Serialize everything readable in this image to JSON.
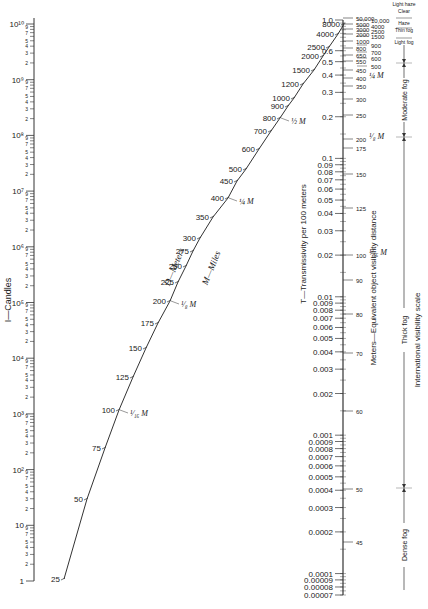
{
  "chart_data": {
    "type": "nomogram",
    "scales": {
      "candles": {
        "label": "I—Candles",
        "range": [
          1,
          10000000000
        ],
        "major_ticks": [
          "1",
          "10",
          "10²",
          "10³",
          "10⁴",
          "10⁵",
          "10⁶",
          "10⁷",
          "10⁸",
          "10⁹",
          "10¹⁰"
        ],
        "minor_tick_labels": [
          "2",
          "3",
          "4",
          "5",
          "7",
          "9"
        ]
      },
      "distance": {
        "label_meters": "D—Meters",
        "label_miles": "M—Miles",
        "meter_ticks": [
          25,
          50,
          75,
          100,
          125,
          150,
          175,
          200,
          225,
          250,
          275,
          300,
          350,
          400,
          450,
          500,
          600,
          700,
          800,
          900,
          1000,
          1200,
          1500,
          2000,
          2500,
          4000,
          8000
        ],
        "mile_marks": [
          {
            "label": "1/16 M",
            "at_meters": 100
          },
          {
            "label": "1/8 M",
            "at_meters": 200
          },
          {
            "label": "1/4 M",
            "at_meters": 400
          },
          {
            "label": "1/2 M",
            "at_meters": 800
          }
        ]
      },
      "transmissivity": {
        "label": "T—Transmissivity per 100 meters",
        "ticks": [
          "1.0",
          "0.6",
          "0.5",
          "0.4",
          "0.3",
          "0.2",
          "0.1",
          "0.09",
          "0.08",
          "0.07",
          "0.06",
          "0.05",
          "0.04",
          "0.03",
          "0.02",
          "0.01",
          "0.009",
          "0.008",
          "0.007",
          "0.006",
          "0.005",
          "0.004",
          "0.003",
          "0.002",
          "0.001",
          "0.0009",
          "0.0008",
          "0.0007",
          "0.0006",
          "0.0005",
          "0.0004",
          "0.0003",
          "0.0002",
          "0.0001",
          "0.00009",
          "0.00008",
          "0.00007"
        ]
      },
      "visibility_distance": {
        "label": "Meters—Equivalent object visibility distance",
        "ticks_left_column": [
          "50,000",
          "5000",
          "3000",
          "2000",
          "1000",
          "800",
          "650",
          "550",
          "450",
          "400",
          "350",
          "300",
          "250",
          "200",
          "175",
          "150",
          "125",
          "100",
          "90",
          "80",
          "70",
          "60",
          "50",
          "45"
        ],
        "ticks_right_column": [
          "10,000",
          "4000",
          "2500",
          "1500",
          "900",
          "700",
          "600",
          "500"
        ],
        "mile_marks": [
          {
            "label": "1/4 M",
            "at": 400
          },
          {
            "label": "1/8 M",
            "at": 200
          },
          {
            "label": "1/16 M",
            "at": 100
          }
        ]
      },
      "international_visibility": {
        "label": "International visibility scale",
        "categories": [
          "Light haze",
          "Clear",
          "Haze",
          "Thin fog",
          "Light fog",
          "Moderate fog",
          "Thick fog",
          "Dense fog"
        ]
      }
    }
  }
}
